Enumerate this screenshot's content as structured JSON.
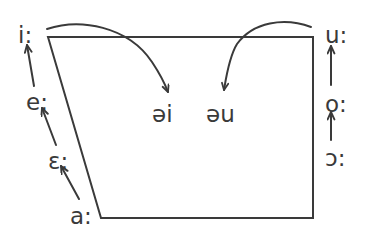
{
  "diagram": {
    "type": "ipa-vowel-trapezoid",
    "stroke_color": "#3a3a3a",
    "background_color": "#ffffff",
    "text_color": "#3a3a3a",
    "stroke_width": 2
  },
  "left_axis": {
    "name": "front-vowel-raising-series",
    "direction": "upward",
    "vowels": [
      {
        "symbol": "i:",
        "x": 18,
        "y": 24
      },
      {
        "symbol": "e:",
        "x": 26,
        "y": 91
      },
      {
        "symbol": "ɛ:",
        "x": 48,
        "y": 150
      },
      {
        "symbol": "a:",
        "x": 70,
        "y": 205
      }
    ],
    "arrows": [
      {
        "name": "arrow-e-to-i",
        "from": "e:",
        "to": "i:"
      },
      {
        "name": "arrow-epsilon-to-e",
        "from": "ɛ:",
        "to": "e:"
      },
      {
        "name": "arrow-a-to-epsilon",
        "from": "a:",
        "to": "ɛ:"
      }
    ]
  },
  "right_axis": {
    "name": "back-vowel-raising-series",
    "direction": "upward",
    "vowels": [
      {
        "symbol": "u:",
        "x": 325,
        "y": 24
      },
      {
        "symbol": "o:",
        "x": 325,
        "y": 93
      },
      {
        "symbol": "ɔ:",
        "x": 325,
        "y": 147
      }
    ],
    "arrows": [
      {
        "name": "arrow-o-to-u",
        "from": "o:",
        "to": "u:"
      },
      {
        "name": "arrow-openo-to-o",
        "from": "ɔ:",
        "to": "o:"
      }
    ]
  },
  "center_labels": [
    {
      "name": "diphthong-ei",
      "symbol": "əi",
      "x": 152,
      "y": 103
    },
    {
      "name": "diphthong-eu",
      "symbol": "əu",
      "x": 206,
      "y": 103
    }
  ],
  "curved_arrows": [
    {
      "name": "curve-i-to-schwa-i",
      "from": "i:",
      "to": "əi",
      "description": "curved arrow from high front i: arcing over and down to əi"
    },
    {
      "name": "curve-u-to-schwa-u",
      "from": "u:",
      "to": "əu",
      "description": "curved arrow from high back u: arcing over and down to əu"
    }
  ],
  "trapezoid": {
    "name": "vowel-quadrilateral",
    "corners": {
      "top_left": {
        "x": 48,
        "y": 37
      },
      "top_right": {
        "x": 313,
        "y": 37
      },
      "bottom_right": {
        "x": 313,
        "y": 218
      },
      "bottom_left": {
        "x": 101,
        "y": 218
      }
    }
  }
}
